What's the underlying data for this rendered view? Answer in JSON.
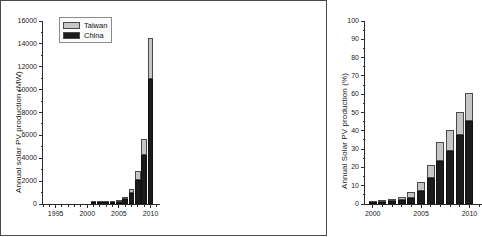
{
  "figure": {
    "panels": [
      "left",
      "right"
    ],
    "legend": {
      "entries": [
        {
          "label": "Taiwan",
          "color": "#c6c6c6"
        },
        {
          "label": "China",
          "color": "#1b1b1b"
        }
      ]
    }
  },
  "chart_data": [
    {
      "type": "bar",
      "stacked": true,
      "panel": "left",
      "title": "",
      "xlabel": "",
      "ylabel": "Annual solar PV production (MW)",
      "xlim": [
        1993,
        2011.5
      ],
      "ylim": [
        0,
        16000
      ],
      "ytick_labels": [
        "0",
        "2000",
        "4000",
        "6000",
        "8000",
        "10000",
        "12000",
        "14000",
        "16000"
      ],
      "ytick_values": [
        0,
        2000,
        4000,
        6000,
        8000,
        10000,
        12000,
        14000,
        16000
      ],
      "xtick_labels": [
        "1995",
        "2000",
        "2005",
        "2010"
      ],
      "xtick_values": [
        1995,
        2000,
        2005,
        2010
      ],
      "grid": false,
      "legend_position": "top-left",
      "categories": [
        2001,
        2002,
        2003,
        2004,
        2005,
        2006,
        2007,
        2008,
        2009,
        2010
      ],
      "series": [
        {
          "name": "China",
          "color": "#1b1b1b",
          "values": [
            8,
            20,
            45,
            90,
            160,
            420,
            1000,
            2100,
            4300,
            10900
          ]
        },
        {
          "name": "Taiwan",
          "color": "#c6c6c6",
          "values": [
            4,
            12,
            25,
            50,
            110,
            220,
            350,
            800,
            1400,
            3600
          ]
        }
      ],
      "totals": [
        12,
        32,
        70,
        140,
        270,
        640,
        1350,
        2900,
        5700,
        14500
      ]
    },
    {
      "type": "bar",
      "stacked": true,
      "panel": "right",
      "title": "",
      "xlabel": "",
      "ylabel": "Annual Solar PV production (%)",
      "xlim": [
        1999.2,
        2011.3
      ],
      "ylim": [
        0,
        100
      ],
      "ytick_labels": [
        "0",
        "10",
        "20",
        "30",
        "40",
        "50",
        "60",
        "70",
        "80",
        "90",
        "100"
      ],
      "ytick_values": [
        0,
        10,
        20,
        30,
        40,
        50,
        60,
        70,
        80,
        90,
        100
      ],
      "xtick_labels": [
        "2000",
        "2005",
        "2010"
      ],
      "xtick_values": [
        2000,
        2005,
        2010
      ],
      "grid": false,
      "categories": [
        2000,
        2001,
        2002,
        2003,
        2004,
        2005,
        2006,
        2007,
        2008,
        2009,
        2010
      ],
      "series": [
        {
          "name": "China",
          "color": "#1b1b1b",
          "values": [
            0.4,
            0.9,
            1.6,
            2.1,
            3.4,
            7.2,
            14.0,
            23.5,
            29.0,
            37.5,
            45.5
          ]
        },
        {
          "name": "Taiwan",
          "color": "#c6c6c6",
          "values": [
            0.3,
            0.4,
            1.1,
            1.6,
            3.4,
            4.9,
            7.1,
            10.4,
            11.2,
            12.6,
            15.2
          ]
        }
      ],
      "totals": [
        0.7,
        1.3,
        2.7,
        3.7,
        6.8,
        12.1,
        21.1,
        33.9,
        40.2,
        50.1,
        60.7
      ]
    }
  ]
}
